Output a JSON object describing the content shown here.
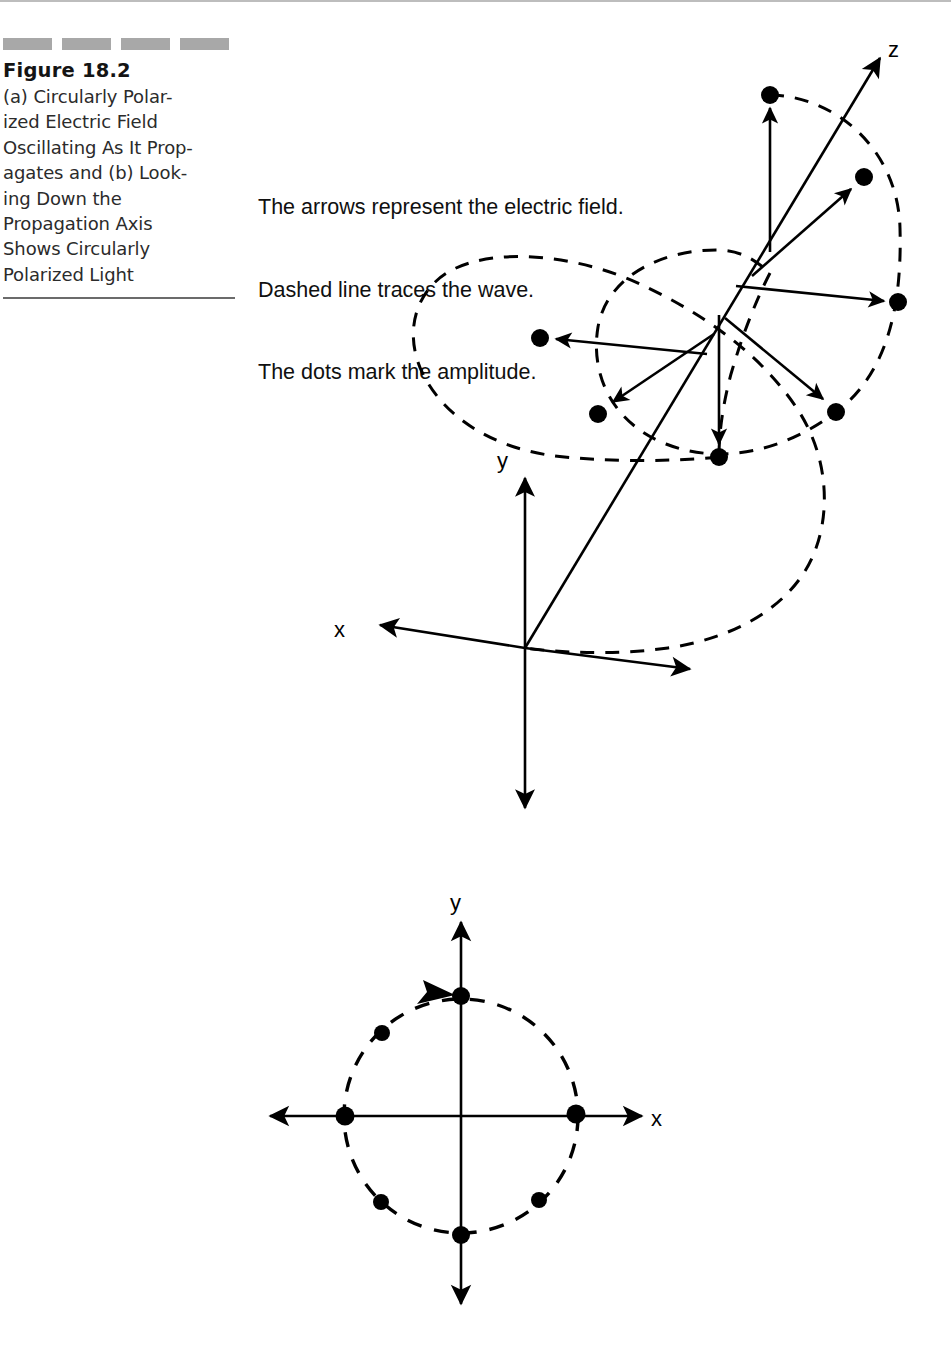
{
  "caption": {
    "figure_number": "Figure 18.2",
    "body": "(a) Circularly Polarized Electric Field Oscillating As It Propagates and (b) Looking Down the Propagation Axis Shows Circularly Polarized Light",
    "lines": [
      "(a) Circularly Polar-",
      "ized Electric Field",
      "Oscillating As It Prop-",
      "agates and (b) Look-",
      "ing Down the",
      "Propagation Axis",
      "Shows Circularly",
      "Polarized Light"
    ],
    "decoration_blocks": 4,
    "decoration_color": "#a8a8a8",
    "rule_color": "#6b6b6b"
  },
  "annotation": {
    "line1": "The arrows represent the electric field.",
    "line2": "Dashed line traces the wave.",
    "line3": "The dots mark the amplitude."
  },
  "figure_a": {
    "name": "circularly-polarized-wave-3d",
    "axis_labels": {
      "x": "x",
      "y": "y",
      "z": "z"
    },
    "origin": {
      "x": 525,
      "y": 648
    },
    "z_tip": {
      "x": 884,
      "y": 54
    },
    "x_tip": {
      "x": 374,
      "y": 624
    },
    "y_up_tip": {
      "x": 525,
      "y": 470
    },
    "y_down_tip": {
      "x": 525,
      "y": 816
    },
    "x_back_tip": {
      "x": 697,
      "y": 670
    },
    "field_vectors": [
      {
        "angle_deg": 90,
        "tail": {
          "x": 770,
          "y": 252
        },
        "tip": {
          "x": 770,
          "y": 104
        },
        "dot": {
          "x": 770,
          "y": 95
        }
      },
      {
        "angle_deg": 45,
        "tail": {
          "x": 752,
          "y": 276
        },
        "tip": {
          "x": 855,
          "y": 185
        },
        "dot": {
          "x": 864,
          "y": 177
        }
      },
      {
        "angle_deg": 0,
        "tail": {
          "x": 736,
          "y": 286
        },
        "tip": {
          "x": 888,
          "y": 302
        },
        "dot": {
          "x": 898,
          "y": 302
        }
      },
      {
        "angle_deg": 180,
        "tail": {
          "x": 707,
          "y": 354
        },
        "tip": {
          "x": 551,
          "y": 338
        },
        "dot": {
          "x": 540,
          "y": 338
        }
      },
      {
        "angle_deg": 225,
        "tail": {
          "x": 714,
          "y": 334
        },
        "tip": {
          "x": 609,
          "y": 405
        },
        "dot": {
          "x": 598,
          "y": 414
        }
      },
      {
        "angle_deg": 315,
        "tail": {
          "x": 725,
          "y": 318
        },
        "tip": {
          "x": 827,
          "y": 403
        },
        "dot": {
          "x": 836,
          "y": 412
        }
      },
      {
        "angle_deg": 270,
        "tail": {
          "x": 719,
          "y": 315
        },
        "tip": {
          "x": 719,
          "y": 447
        },
        "dot": {
          "x": 719,
          "y": 457
        }
      }
    ],
    "dot_count": 7,
    "helix_loops": 2
  },
  "figure_b": {
    "name": "circular-polarization-head-on",
    "axis_labels": {
      "x": "x",
      "y": "y"
    },
    "origin": {
      "x": 461,
      "y": 1116
    },
    "radius": 117,
    "x_left_tip": {
      "x": 263,
      "y": 1115
    },
    "x_right_tip": {
      "x": 650,
      "y": 1115
    },
    "y_up_tip": {
      "x": 461,
      "y": 916
    },
    "y_down_tip": {
      "x": 461,
      "y": 1310
    },
    "rotation_arrow": {
      "x": 437,
      "y": 999,
      "direction": "clockwise-from-upper-left"
    },
    "dots": [
      {
        "label": "top",
        "x": 461,
        "y": 996
      },
      {
        "label": "upper-left",
        "x": 382,
        "y": 1033
      },
      {
        "label": "left",
        "x": 345,
        "y": 1115
      },
      {
        "label": "lower-left",
        "x": 381,
        "y": 1202
      },
      {
        "label": "bottom",
        "x": 461,
        "y": 1235
      },
      {
        "label": "lower-right",
        "x": 539,
        "y": 1200
      },
      {
        "label": "right",
        "x": 576,
        "y": 1114
      }
    ],
    "dot_count": 7
  },
  "colors": {
    "ink": "#000000",
    "background": "#ffffff",
    "caption_text": "#2b2b2b",
    "decoration": "#a8a8a8"
  }
}
